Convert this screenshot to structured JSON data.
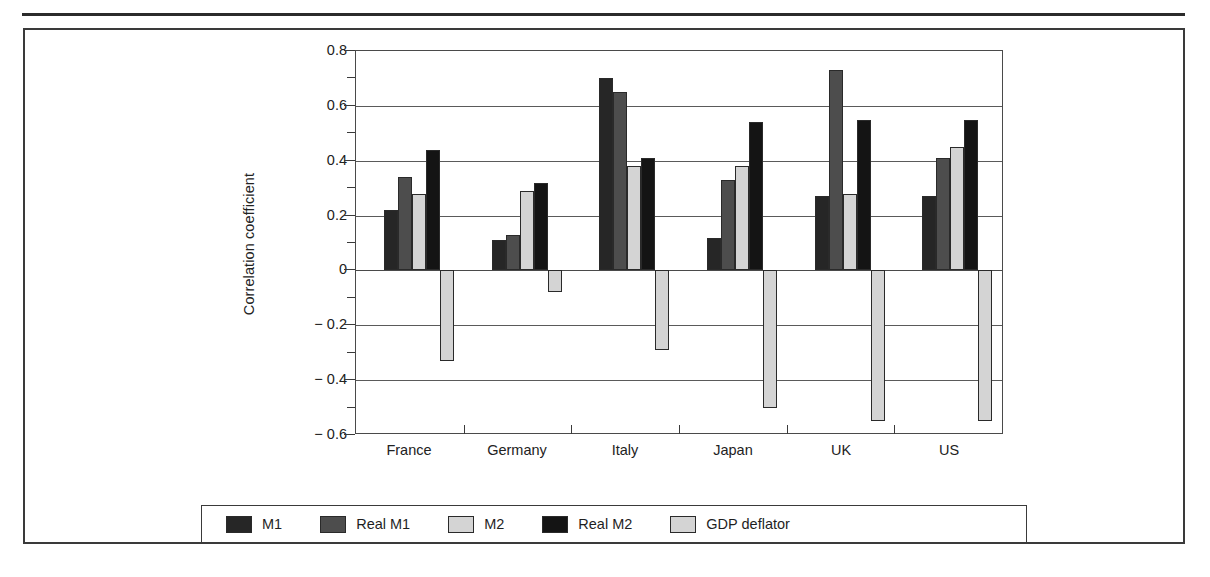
{
  "figure": {
    "y_axis_label": "Correlation coefficient"
  },
  "chart_data": {
    "type": "bar",
    "title": "",
    "xlabel": "",
    "ylabel": "Correlation coefficient",
    "ylim": [
      -0.6,
      0.8
    ],
    "ytick_labels": [
      "0.8",
      "0.6",
      "0.4",
      "0.2",
      "0",
      "− 0.2",
      "− 0.4",
      "− 0.6"
    ],
    "ytick_values": [
      0.8,
      0.6,
      0.4,
      0.2,
      0,
      -0.2,
      -0.4,
      -0.6
    ],
    "minor_ticks": [
      0.7,
      0.5,
      0.3,
      0.1,
      -0.1,
      -0.3,
      -0.5
    ],
    "grid": true,
    "legend_position": "bottom",
    "categories": [
      "France",
      "Germany",
      "Italy",
      "Japan",
      "UK",
      "US"
    ],
    "series": [
      {
        "name": "M1",
        "color": "#262626",
        "values": [
          0.22,
          0.11,
          0.7,
          0.12,
          0.27,
          0.27
        ]
      },
      {
        "name": "Real M1",
        "color": "#4d4d4d",
        "values": [
          0.34,
          0.13,
          0.65,
          0.33,
          0.73,
          0.41
        ]
      },
      {
        "name": "M2",
        "color": "#d4d4d4",
        "values": [
          0.28,
          0.29,
          0.38,
          0.38,
          0.28,
          0.45
        ]
      },
      {
        "name": "Real M2",
        "color": "#141414",
        "values": [
          0.44,
          0.32,
          0.41,
          0.54,
          0.55,
          0.55
        ]
      },
      {
        "name": "GDP deflator",
        "color": "#d4d4d4",
        "values": [
          -0.33,
          -0.08,
          -0.29,
          -0.5,
          -0.55,
          -0.55
        ]
      }
    ]
  }
}
